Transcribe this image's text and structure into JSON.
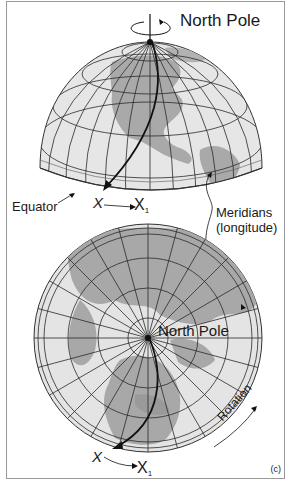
{
  "figure": {
    "panel_label": "(c)",
    "top_globe": {
      "north_pole_label": "North Pole",
      "equator_label": "Equator",
      "x_label": "X",
      "x1_label": "X",
      "x1_subscript": "1"
    },
    "meridians_label_line1": "Meridians",
    "meridians_label_line2": "(longitude)",
    "bottom_globe": {
      "north_pole_label": "North Pole",
      "x_label": "X",
      "x1_label": "X",
      "x1_subscript": "1",
      "rotation_label": "Rotation"
    },
    "colors": {
      "ocean": "#e4e4e4",
      "land": "#a8a8a8",
      "grid": "#2a2a2a",
      "border": "#9a9a9a"
    }
  }
}
